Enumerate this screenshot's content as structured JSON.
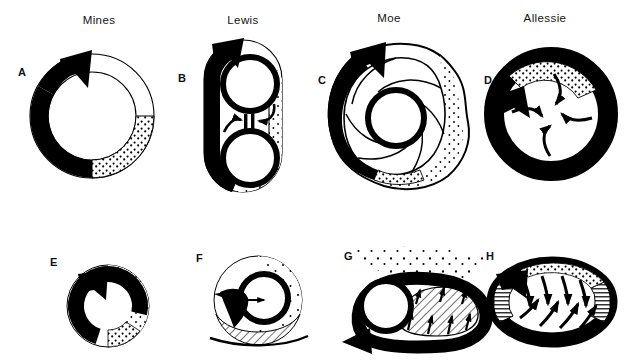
{
  "figure": {
    "kind": "scientific-diagram",
    "background_color": "#ffffff",
    "ink_color": "#000000",
    "rows": 2,
    "columns": 4
  },
  "column_titles": [
    {
      "label": "Mines",
      "x": 99,
      "y": 14
    },
    {
      "label": "Lewis",
      "x": 243,
      "y": 14
    },
    {
      "label": "Moe",
      "x": 389,
      "y": 12
    },
    {
      "label": "Allessie",
      "x": 545,
      "y": 12
    }
  ],
  "panels": [
    {
      "id": "A",
      "letter": "A",
      "title_ref": "Mines",
      "row": 1,
      "column": 1,
      "model": "circus-movement-ring",
      "features": [
        "outer thin ring outline",
        "thick black leading arrow on left sweeping clockwise",
        "stippled excitable-gap region at lower right",
        "arrowhead at top"
      ],
      "letter_pos": {
        "x": 18,
        "y": 66
      }
    },
    {
      "id": "B",
      "letter": "B",
      "title_ref": "Lewis",
      "row": 1,
      "column": 2,
      "model": "circus-movement-around-obstacle",
      "features": [
        "elongated stadium-shaped outer outline",
        "two inner black circles (vena cavae)",
        "thick black limb on the left side",
        "two converging arrows meeting at a collision bar",
        "collision bar symbol",
        "stippled region at lower right"
      ],
      "collision_symbol": "||",
      "letter_pos": {
        "x": 178,
        "y": 72
      }
    },
    {
      "id": "C",
      "letter": "C",
      "title_ref": "Moe",
      "row": 1,
      "column": 3,
      "model": "multiple-wavelet / leading-circle with spiral arms",
      "features": [
        "irregular lobed outer boundary",
        "thick black leading arrow on the left",
        "central black core ring",
        "five pinwheel spiral wavefront arms",
        "stippled region along right and bottom edges"
      ],
      "letter_pos": {
        "x": 318,
        "y": 74
      }
    },
    {
      "id": "D",
      "letter": "D",
      "title_ref": "Allessie",
      "row": 1,
      "column": 4,
      "model": "leading-circle-reentry",
      "features": [
        "thick black annulus",
        "four centripetal curved arrows pointing to the centre",
        "stippled arc across the upper ring segment",
        "black arrowhead at upper left"
      ],
      "letter_pos": {
        "x": 484,
        "y": 74
      }
    },
    {
      "id": "E",
      "letter": "E",
      "title_ref": "Mines",
      "row": 2,
      "column": 1,
      "model": "circus-movement-ring-small",
      "features": [
        "small thick black ring arrow",
        "stippled excitable gap on the right/lower-right",
        "arrowhead at top left"
      ],
      "letter_pos": {
        "x": 52,
        "y": 258
      }
    },
    {
      "id": "F",
      "letter": "F",
      "title_ref": "Lewis",
      "row": 2,
      "column": 2,
      "model": "reentry-around-anatomical-obstacle",
      "features": [
        "thin circular outer boundary",
        "heavy black inner ring (obstacle)",
        "black wedge arrow entering from the left",
        "diagonally hatched region across the lower half",
        "curved baseline beneath the panel"
      ],
      "letter_pos": {
        "x": 200,
        "y": 256
      }
    },
    {
      "id": "G",
      "letter": "G",
      "title_ref": "Moe",
      "row": 2,
      "column": 3,
      "model": "figure-of-eight / hatched-barrier reentry",
      "features": [
        "black inner circle at the left",
        "thick black arrow looping around the bottom",
        "diagonally hatched elongated barrier",
        "small arrows crossing the barrier",
        "scattered stipple cloud above"
      ],
      "letter_pos": {
        "x": 346,
        "y": 256
      }
    },
    {
      "id": "H",
      "letter": "H",
      "title_ref": "Allessie",
      "row": 2,
      "column": 4,
      "model": "leading-circle ellipse with lateral block",
      "features": [
        "black elliptical annulus",
        "line-hatched blocked segments at both ends",
        "eight curved centripetal arrows inside",
        "stippled arc along the upper border",
        "black arrowhead at upper left"
      ],
      "letter_pos": {
        "x": 489,
        "y": 256
      }
    }
  ]
}
